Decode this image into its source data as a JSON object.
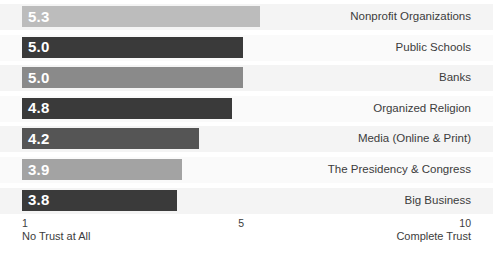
{
  "chart_data": {
    "type": "bar",
    "title": "",
    "subtitle": "",
    "xlabel": "",
    "ylabel": "",
    "orientation": "horizontal",
    "grid": false,
    "legend": "none",
    "xlim": [
      1,
      10
    ],
    "axis_ticks": [
      {
        "value": 1,
        "label": "1",
        "caption": "No Trust at All"
      },
      {
        "value": 5,
        "label": "5",
        "caption": ""
      },
      {
        "value": 10,
        "label": "10",
        "caption": "Complete Trust"
      }
    ],
    "categories": [
      "Nonprofit Organizations",
      "Public Schools",
      "Banks",
      "Organized Religion",
      "Media (Online & Print)",
      "The Presidency & Congress",
      "Big Business"
    ],
    "values": [
      5.3,
      5.0,
      5.0,
      4.8,
      4.2,
      3.9,
      3.8
    ],
    "value_labels": [
      "5.3",
      "5.0",
      "5.0",
      "4.8",
      "4.2",
      "3.9",
      "3.8"
    ],
    "bar_colors": [
      "#bcbcbc",
      "#3a3a3a",
      "#8a8a8a",
      "#3a3a3a",
      "#555555",
      "#a3a3a3",
      "#3a3a3a"
    ],
    "rows": [
      {
        "category": "Nonprofit Organizations",
        "value": 5.3,
        "label": "5.3",
        "color": "#bcbcbc"
      },
      {
        "category": "Public Schools",
        "value": 5.0,
        "label": "5.0",
        "color": "#3a3a3a"
      },
      {
        "category": "Banks",
        "value": 5.0,
        "label": "5.0",
        "color": "#8a8a8a"
      },
      {
        "category": "Organized Religion",
        "value": 4.8,
        "label": "4.8",
        "color": "#3a3a3a"
      },
      {
        "category": "Media (Online & Print)",
        "value": 4.2,
        "label": "4.2",
        "color": "#555555"
      },
      {
        "category": "The Presidency & Congress",
        "value": 3.9,
        "label": "3.9",
        "color": "#a3a3a3"
      },
      {
        "category": "Big Business",
        "value": 3.8,
        "label": "3.8",
        "color": "#3a3a3a"
      }
    ]
  },
  "colors": {
    "background": "#ffffff",
    "row_band": "#f4f4f4",
    "row_band_alt": "#fafafa",
    "text": "#3c3c3c",
    "value_text": "#ffffff",
    "light_gray": "#bcbcbc",
    "medium_gray": "#8a8a8a",
    "dark_gray": "#3a3a3a"
  }
}
